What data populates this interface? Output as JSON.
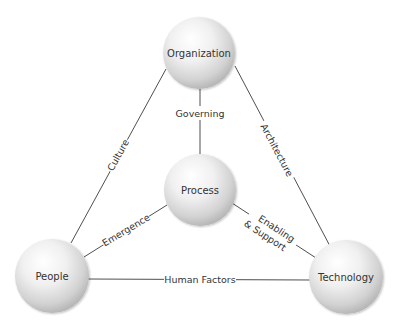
{
  "diagram": {
    "nodes": {
      "organization": {
        "label": "Organization",
        "cx": 199,
        "cy": 53,
        "r": 36
      },
      "process": {
        "label": "Process",
        "cx": 200,
        "cy": 190,
        "r": 36
      },
      "people": {
        "label": "People",
        "cx": 52,
        "cy": 276,
        "r": 37
      },
      "technology": {
        "label": "Technology",
        "cx": 346,
        "cy": 277,
        "r": 37
      }
    },
    "edges": {
      "culture": {
        "label": "Culture",
        "from": "organization",
        "to": "people"
      },
      "architecture": {
        "label": "Architecture",
        "from": "organization",
        "to": "technology"
      },
      "governing": {
        "label": "Governing",
        "from": "organization",
        "to": "process"
      },
      "emergence": {
        "label": "Emergence",
        "from": "process",
        "to": "people"
      },
      "enabling_support": {
        "label_line1": "Enabling",
        "label_line2": "& Support",
        "from": "process",
        "to": "technology"
      },
      "human_factors": {
        "label": "Human Factors",
        "from": "people",
        "to": "technology"
      }
    },
    "colors": {
      "sphere_highlight": "#ffffff",
      "sphere_mid": "#e4e4e4",
      "sphere_shadow": "#a8a8a8",
      "line": "#3a3a3a",
      "text": "#333333"
    }
  }
}
